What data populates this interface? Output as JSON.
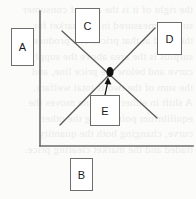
{
  "figure": {
    "type": "economics-supply-demand-diagram",
    "background_color": "#fbfbfa",
    "line_color": "#5a5a5a",
    "axis_color": "#6d6d6d",
    "marker_color": "#111111",
    "bleed_text": "the right of it is the area of consumer\nsurplus measured in the market for\nthe good at that price. The producer\nsurplus is the area above the supply\ncurve and below the price line, and\nthe sum of the two is total welfare.\nA shift in either schedule moves the\nequilibrium point along the other\ncurve, changing both the quantity\ntraded and the market clearing price."
  },
  "axes": {
    "vertical": {
      "label": "price-axis",
      "x": 40,
      "y_top": 11,
      "y_bottom": 146
    },
    "horizontal": {
      "label": "quantity-axis",
      "y": 146,
      "x_left": 40,
      "x_right": 193
    }
  },
  "curves": [
    {
      "name": "demand-curve",
      "slope": "downward",
      "x1": 62,
      "y1": 31,
      "x2": 157,
      "y2": 118
    },
    {
      "name": "supply-curve",
      "slope": "upward",
      "x1": 60,
      "y1": 125,
      "x2": 155,
      "y2": 28
    }
  ],
  "equilibrium": {
    "name": "equilibrium-point",
    "x": 110,
    "y": 72,
    "radius_x": 3.5,
    "radius_y": 5
  },
  "arrow": {
    "name": "callout-e-arrow",
    "from_x": 105,
    "from_y": 95,
    "to_x": 108,
    "to_y": 79
  },
  "callouts": [
    {
      "id": "a",
      "label": "A",
      "x": 11,
      "y": 28,
      "width": 23,
      "height": 38
    },
    {
      "id": "b",
      "label": "B",
      "x": 70,
      "y": 158,
      "width": 23,
      "height": 33
    },
    {
      "id": "c",
      "label": "C",
      "x": 75,
      "y": 8,
      "width": 25,
      "height": 35
    },
    {
      "id": "d",
      "label": "D",
      "x": 157,
      "y": 22,
      "width": 25,
      "height": 33
    },
    {
      "id": "e",
      "label": "E",
      "x": 90,
      "y": 95,
      "width": 30,
      "height": 31
    }
  ]
}
